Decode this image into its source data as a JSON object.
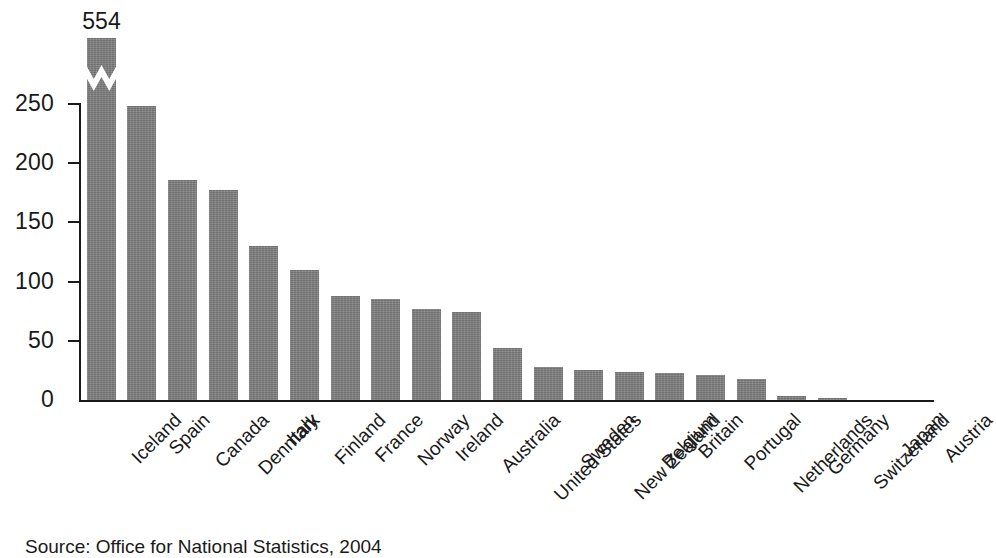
{
  "chart_data": {
    "type": "bar",
    "title": "",
    "subtitle": "",
    "xlabel": "",
    "ylabel": "",
    "ylim": [
      0,
      250
    ],
    "y_ticks": [
      0,
      50,
      100,
      150,
      200,
      250
    ],
    "grid": false,
    "legend": null,
    "axis_break": {
      "present": true,
      "category": "Iceland",
      "note": "Iceland bar is truncated with a zigzag break; true value 554 printed above the bar"
    },
    "categories": [
      "Iceland",
      "Spain",
      "Canada",
      "Denmark",
      "Italy",
      "Finland",
      "France",
      "Norway",
      "Ireland",
      "Australia",
      "United States",
      "Sweden",
      "New Zealand",
      "Belgium",
      "Britain",
      "Portugal",
      "Netherlands",
      "Germany",
      "Switzerland",
      "Japan",
      "Austria"
    ],
    "values": [
      554,
      248,
      186,
      177,
      130,
      110,
      88,
      85,
      77,
      74,
      44,
      28,
      25,
      24,
      23,
      21,
      18,
      3,
      1,
      0,
      0
    ],
    "data_labels": {
      "Iceland": "554"
    },
    "source": "Source: Office for National Statistics, 2004"
  },
  "colors": {
    "bar_fill": "#7d7d7d",
    "axis": "#1a1a1a",
    "text": "#1a1a1a",
    "background": "#ffffff"
  }
}
